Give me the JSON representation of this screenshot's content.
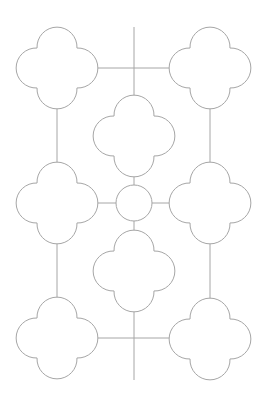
{
  "diagram": {
    "canvas": {
      "width": 264,
      "height": 403,
      "background": "#ffffff"
    },
    "stroke_color": "#a6a6a6",
    "quatrefoil": {
      "lobe_offset": 19,
      "lobe_radius": 20
    },
    "nodes": [
      {
        "id": "top-left",
        "type": "quatrefoil",
        "cx": 57,
        "cy": 68
      },
      {
        "id": "top-right",
        "type": "quatrefoil",
        "cx": 210,
        "cy": 68
      },
      {
        "id": "center-top",
        "type": "quatrefoil",
        "cx": 134,
        "cy": 136
      },
      {
        "id": "middle-left",
        "type": "quatrefoil",
        "cx": 57,
        "cy": 203
      },
      {
        "id": "center",
        "type": "circle",
        "cx": 134,
        "cy": 203,
        "r": 18
      },
      {
        "id": "middle-right",
        "type": "quatrefoil",
        "cx": 210,
        "cy": 203
      },
      {
        "id": "center-bottom",
        "type": "quatrefoil",
        "cx": 134,
        "cy": 271
      },
      {
        "id": "bottom-left",
        "type": "quatrefoil",
        "cx": 57,
        "cy": 338
      },
      {
        "id": "bottom-right",
        "type": "quatrefoil",
        "cx": 210,
        "cy": 339
      }
    ],
    "connectors": [
      {
        "id": "top-horizontal",
        "x1": 96,
        "y1": 68,
        "x2": 171,
        "y2": 68
      },
      {
        "id": "top-vertical-stem",
        "x1": 134,
        "y1": 27,
        "x2": 134,
        "y2": 97
      },
      {
        "id": "left-upper-vertical",
        "x1": 57,
        "y1": 107,
        "x2": 57,
        "y2": 164
      },
      {
        "id": "right-upper-vertical",
        "x1": 210,
        "y1": 107,
        "x2": 210,
        "y2": 164
      },
      {
        "id": "center-top-to-circle",
        "x1": 134,
        "y1": 175,
        "x2": 134,
        "y2": 185
      },
      {
        "id": "middle-left-to-circle",
        "x1": 96,
        "y1": 203,
        "x2": 116,
        "y2": 203
      },
      {
        "id": "circle-to-middle-right",
        "x1": 152,
        "y1": 203,
        "x2": 171,
        "y2": 203
      },
      {
        "id": "circle-to-center-bottom",
        "x1": 134,
        "y1": 221,
        "x2": 134,
        "y2": 232
      },
      {
        "id": "left-lower-vertical",
        "x1": 57,
        "y1": 242,
        "x2": 57,
        "y2": 299
      },
      {
        "id": "right-lower-vertical",
        "x1": 210,
        "y1": 242,
        "x2": 210,
        "y2": 300
      },
      {
        "id": "bottom-horizontal",
        "x1": 96,
        "y1": 338,
        "x2": 171,
        "y2": 338
      },
      {
        "id": "bottom-vertical-stem",
        "x1": 134,
        "y1": 310,
        "x2": 134,
        "y2": 380
      }
    ]
  }
}
